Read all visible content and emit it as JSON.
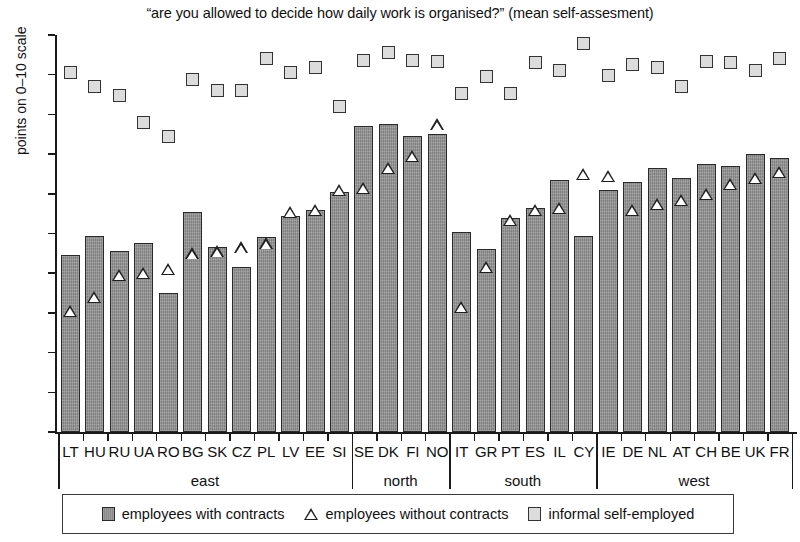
{
  "chart_data": {
    "type": "bar",
    "title": "“are you allowed to decide how daily work is organised?” (mean self-assesment)",
    "xlabel": "",
    "ylabel": "points on 0–10 scale",
    "ylim": [
      0,
      10
    ],
    "yticks": [
      0,
      1,
      2,
      3,
      4,
      5,
      6,
      7,
      8,
      9,
      10
    ],
    "grid": false,
    "legend_position": "bottom",
    "categories": [
      "LT",
      "HU",
      "RU",
      "UA",
      "RO",
      "BG",
      "SK",
      "CZ",
      "PL",
      "LV",
      "EE",
      "SI",
      "SE",
      "DK",
      "FI",
      "NO",
      "IT",
      "GR",
      "PT",
      "ES",
      "IL",
      "CY",
      "IE",
      "DE",
      "NL",
      "AT",
      "CH",
      "BE",
      "UK",
      "FR"
    ],
    "groups": [
      {
        "label": "east",
        "start": 0,
        "end": 11
      },
      {
        "label": "north",
        "start": 12,
        "end": 15
      },
      {
        "label": "south",
        "start": 16,
        "end": 21
      },
      {
        "label": "west",
        "start": 22,
        "end": 29
      }
    ],
    "series": [
      {
        "name": "employees with contracts",
        "marker": "bar",
        "color": "#8f8f8f",
        "values": [
          4.45,
          4.95,
          4.55,
          4.75,
          3.5,
          5.55,
          4.65,
          4.15,
          4.9,
          5.45,
          5.6,
          6.05,
          7.7,
          7.75,
          7.45,
          7.5,
          5.05,
          4.6,
          5.4,
          5.65,
          6.35,
          4.95,
          6.1,
          6.3,
          6.65,
          6.4,
          6.75,
          6.7,
          7.0,
          6.9
        ]
      },
      {
        "name": "employees without contracts",
        "marker": "triangle",
        "color": "#ffffff",
        "values": [
          3.05,
          3.4,
          3.95,
          4.0,
          4.1,
          4.5,
          4.55,
          4.65,
          4.75,
          5.55,
          5.6,
          6.1,
          6.15,
          6.65,
          6.95,
          7.75,
          3.15,
          4.15,
          5.35,
          5.6,
          5.65,
          6.5,
          6.45,
          5.6,
          5.75,
          5.85,
          6.0,
          6.25,
          6.4,
          6.55
        ]
      },
      {
        "name": "informal self-employed",
        "marker": "square",
        "color": "#dcdcdc",
        "values": [
          9.05,
          8.7,
          8.47,
          7.8,
          7.45,
          8.88,
          8.6,
          8.6,
          9.4,
          9.05,
          9.18,
          8.2,
          9.37,
          9.55,
          9.35,
          9.32,
          8.52,
          8.95,
          8.52,
          9.3,
          9.1,
          9.78,
          8.98,
          9.25,
          9.17,
          8.7,
          9.32,
          9.3,
          9.1,
          9.4
        ]
      }
    ]
  },
  "legend": {
    "items": [
      {
        "label": "employees with contracts",
        "icon": "dark-square-icon"
      },
      {
        "label": "employees without  contracts",
        "icon": "triangle-icon"
      },
      {
        "label": "informal self-employed",
        "icon": "light-square-icon"
      }
    ]
  }
}
